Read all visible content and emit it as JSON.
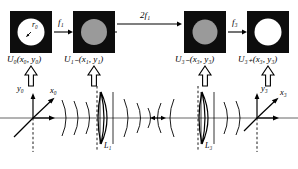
{
  "figure": {
    "type": "optical-system-diagram",
    "background": "#ffffff",
    "ink": "#000000"
  },
  "planes": [
    {
      "id": "plane-0",
      "label": "U",
      "sub": "0",
      "args": "(x",
      "arg_sub1": "0",
      "arg_mid": ", y",
      "arg_sub2": "0",
      "arg_end": ")",
      "full": "U₀(x₀, y₀)",
      "square_fill": "#0d0d0d",
      "circle_fill": "#ffffff",
      "circle_kind": "open-aperture",
      "x": 10,
      "y": 11,
      "size": 42,
      "label_x": 7,
      "label_y": 56
    },
    {
      "id": "plane-1-minus",
      "label": "U",
      "sub": "1−",
      "full": "U₁₋(x₁, y₁)",
      "square_fill": "#0d0d0d",
      "circle_fill": "#9a9a9a",
      "circle_kind": "diffuse-spot",
      "x": 73,
      "y": 11,
      "size": 42,
      "label_x": 66,
      "label_y": 56
    },
    {
      "id": "plane-3-minus",
      "label": "U",
      "sub": "3−",
      "full": "U₃₋(x₃, y₃)",
      "square_fill": "#0d0d0d",
      "circle_fill": "#9a9a9a",
      "circle_kind": "diffuse-spot",
      "x": 184,
      "y": 11,
      "size": 42,
      "label_x": 177,
      "label_y": 56
    },
    {
      "id": "plane-3-plus",
      "label": "U",
      "sub": "3+",
      "full": "U₃₊(x₃, y₃)",
      "square_fill": "#0d0d0d",
      "circle_fill": "#ffffff",
      "circle_kind": "open-aperture",
      "x": 247,
      "y": 11,
      "size": 42,
      "label_x": 240,
      "label_y": 56
    }
  ],
  "distances": [
    {
      "id": "f1",
      "text": "f",
      "sub": "1",
      "full": "f₁",
      "x": 58,
      "y": 22
    },
    {
      "id": "2f1",
      "text": "2f",
      "sub": "1",
      "full": "2f₁",
      "x": 141,
      "y": 16
    },
    {
      "id": "f3",
      "text": "f",
      "sub": "3",
      "full": "f₃",
      "x": 232,
      "y": 22
    }
  ],
  "aperture_radius": {
    "id": "r0",
    "full": "r₀",
    "x": 33,
    "y": 24
  },
  "lenses": [
    {
      "id": "lens-1",
      "full": "L₁",
      "cx": 107,
      "label_x": 104,
      "label_y": 148
    },
    {
      "id": "lens-3",
      "full": "L₃",
      "cx": 208,
      "label_x": 205,
      "label_y": 148
    }
  ],
  "axes": [
    {
      "id": "axes-left",
      "origin_x": 33,
      "origin_y": 118,
      "vertical": {
        "full": "y₀",
        "x": 18,
        "y": 88
      },
      "diagonal": {
        "full": "x₀",
        "x": 50,
        "y": 90
      }
    },
    {
      "id": "axes-right",
      "origin_x": 257,
      "origin_y": 118,
      "vertical": {
        "full": "y₃",
        "x": 261,
        "y": 88
      },
      "diagonal": {
        "full": "x₃",
        "x": 281,
        "y": 92
      }
    }
  ],
  "optical_axis": {
    "y": 118,
    "x_start": 0,
    "x_end": 298
  },
  "center_marker": {
    "type": "double-headed-arrow",
    "cx": 158,
    "cy": 118
  },
  "connector_arrows": [
    {
      "id": "arrow-plane-0",
      "cx": 31,
      "top": 66,
      "bottom": 86
    },
    {
      "id": "arrow-plane-1-minus",
      "cx": 94,
      "top": 66,
      "bottom": 86
    },
    {
      "id": "arrow-plane-3-minus",
      "cx": 205,
      "top": 66,
      "bottom": 86
    },
    {
      "id": "arrow-plane-3-plus",
      "cx": 268,
      "top": 66,
      "bottom": 86
    }
  ]
}
